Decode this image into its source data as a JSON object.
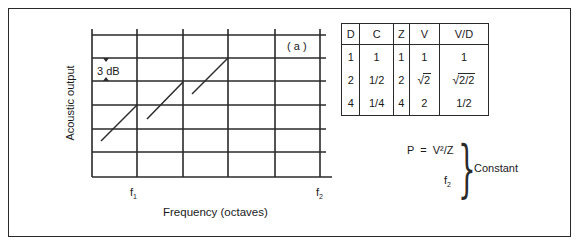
{
  "figure": {
    "panel_label": "( a )",
    "y_axis_label": "Acoustic output",
    "x_axis_label": "Frequency (octaves)",
    "x_tick_f1": "f",
    "x_tick_f1_sub": "1",
    "x_tick_f2": "f",
    "x_tick_f2_sub": "2",
    "step_annotation": "3 dB",
    "grid": {
      "vertical_lines_x": [
        92,
        137,
        183,
        228,
        275,
        320
      ],
      "horizontal_lines_y": [
        35,
        58,
        81,
        105,
        129,
        152,
        177
      ]
    },
    "slope_segments": [
      {
        "x1": 101,
        "y1": 141,
        "x2": 137,
        "y2": 105
      },
      {
        "x1": 147,
        "y1": 119,
        "x2": 183,
        "y2": 82
      },
      {
        "x1": 192,
        "y1": 94,
        "x2": 228,
        "y2": 58
      }
    ]
  },
  "table": {
    "headers": [
      "D",
      "C",
      "Z",
      "V",
      "V/D"
    ],
    "rows": [
      [
        "1",
        "1",
        "1",
        "1",
        "1"
      ],
      [
        "2",
        "1/2",
        "2",
        "√2",
        "√2/2"
      ],
      [
        "4",
        "1/4",
        "4",
        "2",
        "1/2"
      ]
    ],
    "sqrt_cells": {
      "r1_v": "2",
      "r1_vd": "2/2"
    },
    "radical": "√"
  },
  "formula": {
    "line1": "P  =  V²/Z",
    "line2_base": "f",
    "line2_sub": "2",
    "brace": "}",
    "result": "Constant"
  },
  "colors": {
    "ink": "#2a2a2a",
    "background": "#ffffff"
  }
}
